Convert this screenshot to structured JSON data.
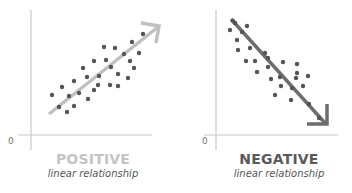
{
  "colors": {
    "axis": "#c8c8c8",
    "dot": "#555555",
    "positive_arrow": "#c0c0c0",
    "negative_arrow": "#6e6e6e",
    "positive_title": "#c4c4c4",
    "negative_title": "#5a5a5a"
  },
  "chart_data": [
    {
      "type": "scatter",
      "title": "POSITIVE",
      "subtitle": "linear relationship",
      "origin_label": "0",
      "trend": "increasing",
      "points_px": [
        [
          52,
          95
        ],
        [
          62,
          87
        ],
        [
          59,
          107
        ],
        [
          67,
          112
        ],
        [
          69,
          96
        ],
        [
          74,
          106
        ],
        [
          74,
          81
        ],
        [
          79,
          93
        ],
        [
          83,
          68
        ],
        [
          87,
          77
        ],
        [
          88,
          99
        ],
        [
          94,
          90
        ],
        [
          94,
          61
        ],
        [
          98,
          85
        ],
        [
          99,
          76
        ],
        [
          104,
          47
        ],
        [
          106,
          60
        ],
        [
          110,
          85
        ],
        [
          111,
          67
        ],
        [
          115,
          48
        ],
        [
          118,
          74
        ],
        [
          118,
          86
        ],
        [
          124,
          54
        ],
        [
          128,
          78
        ],
        [
          130,
          61
        ],
        [
          132,
          42
        ],
        [
          134,
          68
        ],
        [
          139,
          53
        ],
        [
          143,
          34
        ]
      ]
    },
    {
      "type": "scatter",
      "title": "NEGATIVE",
      "subtitle": "linear relationship",
      "origin_label": "0",
      "trend": "decreasing",
      "points_px": [
        [
          233,
          21
        ],
        [
          235,
          23
        ],
        [
          230,
          30
        ],
        [
          242,
          32
        ],
        [
          247,
          26
        ],
        [
          237,
          40
        ],
        [
          238,
          50
        ],
        [
          250,
          48
        ],
        [
          246,
          61
        ],
        [
          255,
          61
        ],
        [
          265,
          53
        ],
        [
          268,
          58
        ],
        [
          257,
          72
        ],
        [
          268,
          67
        ],
        [
          271,
          79
        ],
        [
          280,
          77
        ],
        [
          283,
          62
        ],
        [
          281,
          86
        ],
        [
          275,
          95
        ],
        [
          292,
          88
        ],
        [
          296,
          78
        ],
        [
          297,
          64
        ],
        [
          297,
          73
        ],
        [
          303,
          86
        ],
        [
          308,
          76
        ],
        [
          291,
          100
        ],
        [
          309,
          104
        ],
        [
          319,
          118
        ]
      ]
    }
  ],
  "panels": {
    "positive": {
      "title": "POSITIVE",
      "subtitle": "linear relationship",
      "zero": "0"
    },
    "negative": {
      "title": "NEGATIVE",
      "subtitle": "linear relationship",
      "zero": "0"
    }
  }
}
